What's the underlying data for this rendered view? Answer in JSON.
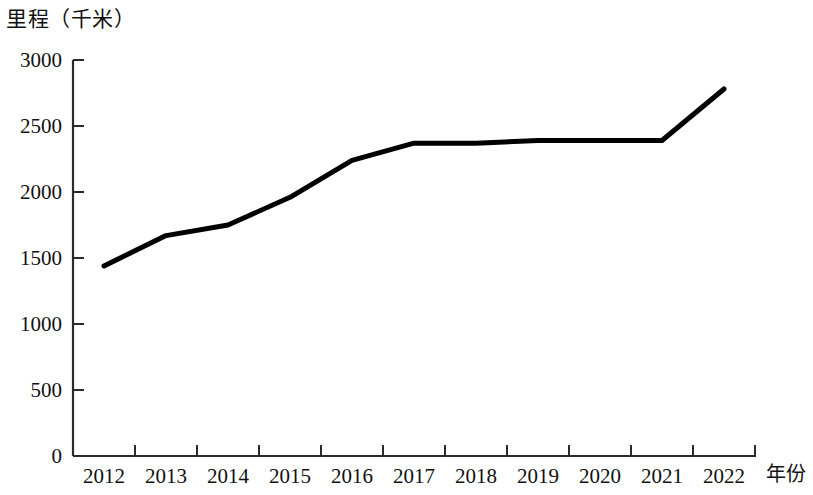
{
  "chart_data": {
    "type": "line",
    "title": "",
    "ylabel": "里程（千米）",
    "xlabel": "年份",
    "categories": [
      "2012",
      "2013",
      "2014",
      "2015",
      "2016",
      "2017",
      "2018",
      "2019",
      "2020",
      "2021",
      "2022"
    ],
    "values": [
      1440,
      1670,
      1750,
      1960,
      2240,
      2370,
      2370,
      2390,
      2390,
      2390,
      2780
    ],
    "series": [
      {
        "name": "里程（千米）",
        "values": [
          1440,
          1670,
          1750,
          1960,
          2240,
          2370,
          2370,
          2390,
          2390,
          2390,
          2780
        ]
      }
    ],
    "x_tick_labels": [
      "2012",
      "2013",
      "2014",
      "2015",
      "2016",
      "2017",
      "2018",
      "2019",
      "2020",
      "2021",
      "2022"
    ],
    "y_tick_labels": [
      "0",
      "500",
      "1000",
      "1500",
      "2000",
      "2500",
      "3000"
    ],
    "y_ticks": [
      0,
      500,
      1000,
      1500,
      2000,
      2500,
      3000
    ],
    "ylim": [
      0,
      3000
    ],
    "grid": false,
    "legend": false,
    "legend_position": "none",
    "line_color": "#000000"
  },
  "axis": {
    "y_title": "里程（千米）",
    "x_title": "年份"
  }
}
